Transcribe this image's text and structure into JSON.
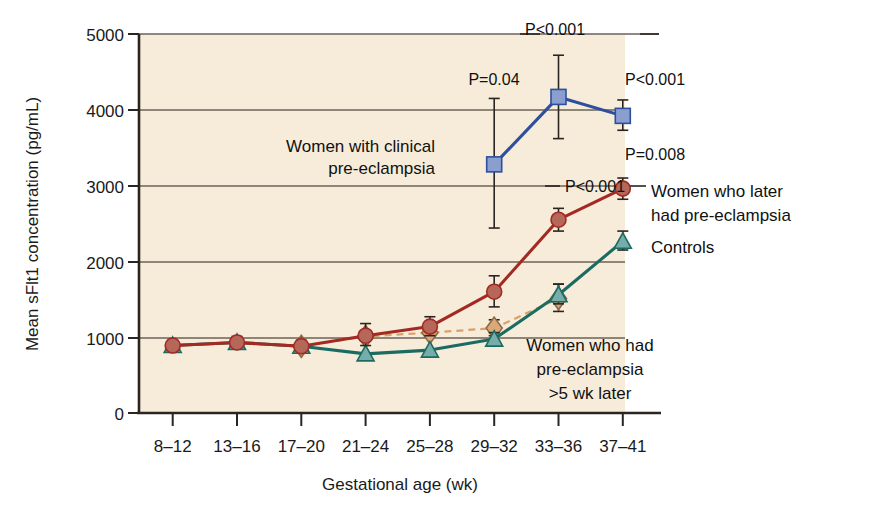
{
  "chart_data": {
    "type": "line",
    "title": "",
    "xlabel": "Gestational age (wk)",
    "ylabel": "Mean sFlt1 concentration (pg/mL)",
    "categories": [
      "8–12",
      "13–16",
      "17–20",
      "21–24",
      "25–28",
      "29–32",
      "33–36",
      "37–41"
    ],
    "ylim": [
      0,
      5000
    ],
    "yticks": [
      0,
      1000,
      2000,
      3000,
      4000,
      5000
    ],
    "ytick_labels": [
      "0",
      "1000",
      "2000",
      "3000",
      "4000",
      "5000"
    ],
    "grid": "horizontal",
    "legend": "inline-annotations",
    "plot_background": "#f7ecd9",
    "series": [
      {
        "name": "Women who later had pre-eclampsia",
        "marker": "circle",
        "color": "#a32a23",
        "marker_fill": "#b5675a",
        "x": [
          "8–12",
          "13–16",
          "17–20",
          "21–24",
          "25–28",
          "29–32",
          "33–36",
          "37–41"
        ],
        "values": [
          890,
          930,
          880,
          1020,
          1140,
          1600,
          2550,
          2960
        ],
        "err_low": [
          840,
          870,
          820,
          890,
          1020,
          1400,
          2400,
          2820
        ],
        "err_high": [
          960,
          1010,
          960,
          1180,
          1270,
          1810,
          2700,
          3100
        ]
      },
      {
        "name": "Controls",
        "marker": "triangle",
        "color": "#1c6b63",
        "marker_fill": "#76adab",
        "x": [
          "8–12",
          "13–16",
          "17–20",
          "21–24",
          "25–28",
          "29–32",
          "33–36",
          "37–41"
        ],
        "values": [
          890,
          930,
          880,
          780,
          830,
          975,
          1560,
          2265
        ],
        "err_low": [
          890,
          930,
          880,
          780,
          830,
          920,
          1440,
          2150
        ],
        "err_high": [
          890,
          930,
          880,
          780,
          830,
          1060,
          1700,
          2400
        ]
      },
      {
        "name": "Women with clinical pre-eclampsia",
        "marker": "square",
        "color": "#2d4f9e",
        "marker_fill": "#8a9fd0",
        "x": [
          "29–32",
          "33–36",
          "37–41"
        ],
        "values": [
          3280,
          4170,
          3920
        ],
        "err_low": [
          2440,
          3620,
          3730
        ],
        "err_high": [
          4150,
          4720,
          4130
        ]
      },
      {
        "name": "Women who had pre-eclampsia >5 wk later",
        "marker": "diamond",
        "color": "#d8a06a",
        "marker_fill": "#dba878",
        "style": "dashed",
        "x": [
          "17–20",
          "21–24",
          "25–28",
          "29–32",
          "33–36"
        ],
        "values": [
          880,
          1010,
          1060,
          1120,
          1510
        ],
        "err_low": [
          880,
          1010,
          1060,
          1020,
          1340
        ],
        "err_high": [
          880,
          1010,
          1060,
          1230,
          1700
        ]
      }
    ],
    "annotations": [
      {
        "name": "p-value-29-32-blue",
        "text": "P=0.04",
        "x": 494,
        "y": 85
      },
      {
        "name": "p-value-33-36-blue",
        "text": "P<0.001",
        "x": 555,
        "y": 35
      },
      {
        "name": "p-value-37-41-blue",
        "text": "P<0.001",
        "x": 655,
        "y": 85
      },
      {
        "name": "p-value-37-41-red",
        "text": "P=0.008",
        "x": 655,
        "y": 160
      },
      {
        "name": "p-value-33-36-red",
        "text": "P<0.001",
        "x": 595,
        "y": 192
      }
    ],
    "series_labels": [
      {
        "name": "label-clinical-pre-eclampsia",
        "lines": [
          "Women with clinical",
          "pre-eclampsia"
        ]
      },
      {
        "name": "label-later-pre-eclampsia",
        "lines": [
          "Women who later",
          "had pre-eclampsia"
        ]
      },
      {
        "name": "label-controls",
        "lines": [
          "Controls"
        ]
      },
      {
        "name": "label-pre-eclampsia-5wk",
        "lines": [
          "Women who had",
          "pre-eclampsia",
          ">5 wk later"
        ]
      }
    ]
  }
}
